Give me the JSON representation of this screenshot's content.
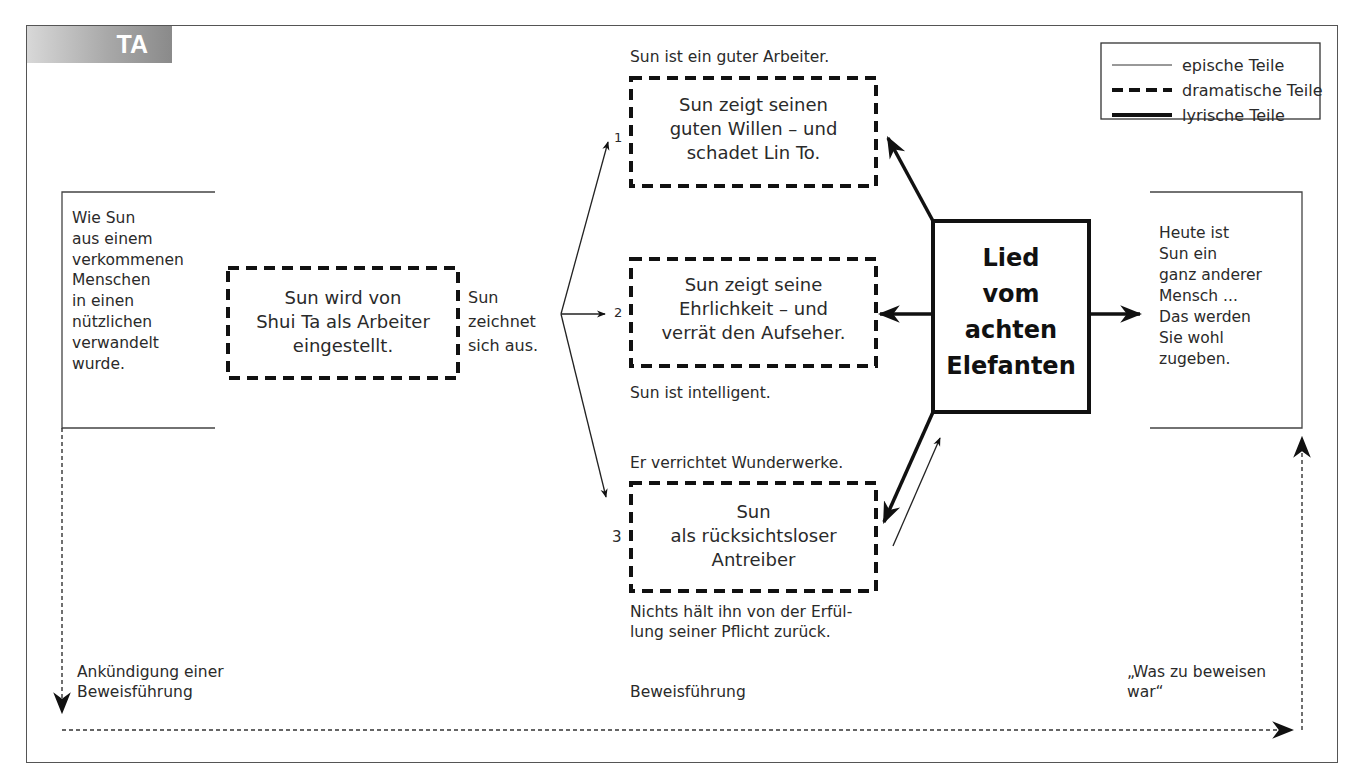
{
  "badge": {
    "label": "TA"
  },
  "legend": {
    "items": [
      {
        "label": "epische Teile",
        "line_style": "thin-solid"
      },
      {
        "label": "dramatische Teile",
        "line_style": "dashed"
      },
      {
        "label": "lyrische Teile",
        "line_style": "thick-solid"
      }
    ]
  },
  "left_epic": {
    "text": "Wie Sun\naus einem\nverkommenen\nMenschen\nin einen\nnützlichen\nverwandelt\nwurde."
  },
  "start_scene": {
    "text": "Sun wird von\nShui Ta als Arbeiter\neingestellt."
  },
  "transition_label": {
    "text": "Sun\nzeichnet\nsich aus."
  },
  "scenes": [
    {
      "number": "1",
      "caption_above": "Sun ist ein guter Arbeiter.",
      "text": "Sun zeigt seinen\nguten Willen – und\nschadet Lin To.",
      "caption_below": ""
    },
    {
      "number": "2",
      "caption_above": "",
      "text": "Sun zeigt seine\nEhrlichkeit – und\nverrät den Aufseher.",
      "caption_below": "Sun ist intelligent."
    },
    {
      "number": "3",
      "caption_above": "Er verrichtet Wunderwerke.",
      "text": "Sun\nals rücksichtsloser\nAntreiber",
      "caption_below": "Nichts hält ihn von der Erfül-\nlung seiner Pflicht zurück."
    }
  ],
  "song": {
    "text": "Lied\nvom\nachten\nElefanten"
  },
  "right_epic": {
    "text": "Heute ist\nSun ein\nganz anderer\nMensch ...\nDas werden\nSie wohl\nzugeben."
  },
  "bottom_labels": {
    "left": "Ankündigung einer\nBeweisführung",
    "center": "Beweisführung",
    "right": "„Was zu beweisen\nwar“"
  },
  "colors": {
    "ink": "#111111",
    "text": "#2a2a2a",
    "frame": "#555555",
    "badge_gradient_end": "#8a8a8a"
  }
}
